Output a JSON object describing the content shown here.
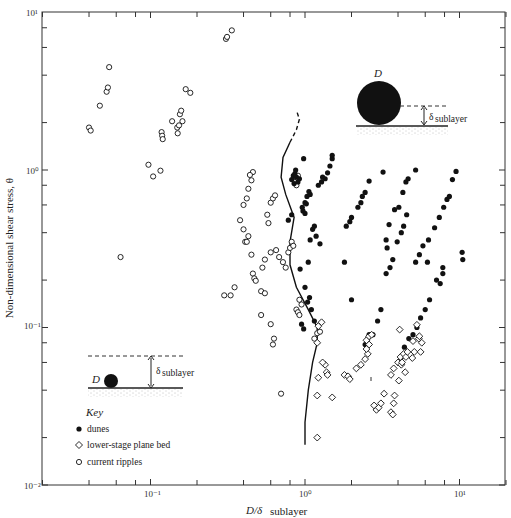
{
  "chart_data": {
    "type": "scatter",
    "title": "",
    "xlabel": "D/δ sublayer",
    "xlabel_main": "D/δ",
    "xlabel_sub": "sublayer",
    "ylabel": "Non-dimensional shear stress, θ",
    "xscale": "log",
    "yscale": "log",
    "xlim": [
      0.02,
      20
    ],
    "ylim": [
      0.01,
      10
    ],
    "grid": false,
    "x_tick_labels": [
      "10⁻¹",
      "10⁰",
      "10¹"
    ],
    "x_ticks": [
      0.1,
      1,
      10
    ],
    "y_tick_labels": [
      "10⁻²",
      "10⁻¹",
      "10⁰",
      "10¹"
    ],
    "y_ticks": [
      0.01,
      0.1,
      1,
      10
    ],
    "legend": {
      "title": "Key",
      "position": "lower-left",
      "entries": [
        {
          "marker": "filled-circle",
          "label": "dunes"
        },
        {
          "marker": "open-diamond",
          "label": "lower-stage plane bed"
        },
        {
          "marker": "open-circle",
          "label": "current ripples"
        }
      ]
    },
    "annotations": [
      {
        "text": "D",
        "context": "large grain protruding through viscous sublayer (upper right inset)"
      },
      {
        "text": "δ sublayer",
        "context": "sublayer thickness arrow in upper right inset"
      },
      {
        "text": "D",
        "context": "small grain submerged in viscous sublayer (lower left inset)"
      },
      {
        "text": "δ sublayer",
        "context": "sublayer thickness arrow in lower left inset"
      }
    ],
    "boundary_curve": {
      "description": "solid curve (dashed at top) separating ripples from dunes/plane bed",
      "points": [
        [
          1.0,
          0.018
        ],
        [
          1.0,
          0.025
        ],
        [
          1.05,
          0.04
        ],
        [
          1.12,
          0.06
        ],
        [
          1.2,
          0.08
        ],
        [
          1.2,
          0.1
        ],
        [
          1.05,
          0.13
        ],
        [
          0.88,
          0.18
        ],
        [
          0.8,
          0.25
        ],
        [
          0.8,
          0.35
        ],
        [
          0.85,
          0.5
        ],
        [
          0.75,
          0.7
        ],
        [
          0.7,
          0.9
        ],
        [
          0.72,
          1.2
        ],
        [
          0.8,
          1.5
        ]
      ],
      "dashed_points": [
        [
          0.8,
          1.5
        ],
        [
          0.88,
          1.8
        ],
        [
          0.92,
          2.1
        ],
        [
          0.88,
          2.4
        ]
      ]
    },
    "series": [
      {
        "name": "current ripples",
        "marker": "open-circle",
        "points": [
          [
            0.04,
            1.86
          ],
          [
            0.041,
            1.78
          ],
          [
            0.047,
            2.56
          ],
          [
            0.052,
            3.14
          ],
          [
            0.053,
            3.34
          ],
          [
            0.054,
            4.5
          ],
          [
            0.064,
            0.28
          ],
          [
            0.097,
            1.08
          ],
          [
            0.104,
            0.91
          ],
          [
            0.116,
            0.99
          ],
          [
            0.118,
            1.74
          ],
          [
            0.119,
            1.65
          ],
          [
            0.12,
            1.57
          ],
          [
            0.138,
            2.04
          ],
          [
            0.149,
            1.86
          ],
          [
            0.15,
            1.71
          ],
          [
            0.153,
            1.92
          ],
          [
            0.155,
            2.26
          ],
          [
            0.158,
            2.38
          ],
          [
            0.161,
            2.04
          ],
          [
            0.169,
            3.26
          ],
          [
            0.181,
            3.09
          ],
          [
            0.308,
            6.8
          ],
          [
            0.313,
            7.0
          ],
          [
            0.336,
            7.7
          ],
          [
            0.3,
            0.16
          ],
          [
            0.33,
            0.16
          ],
          [
            0.35,
            0.18
          ],
          [
            0.4,
            0.6
          ],
          [
            0.42,
            0.66
          ],
          [
            0.43,
            0.76
          ],
          [
            0.45,
            0.86
          ],
          [
            0.46,
            0.97
          ],
          [
            0.44,
            0.93
          ],
          [
            0.41,
            0.35
          ],
          [
            0.42,
            0.35
          ],
          [
            0.43,
            0.38
          ],
          [
            0.38,
            0.48
          ],
          [
            0.4,
            0.42
          ],
          [
            0.46,
            0.22
          ],
          [
            0.47,
            0.205
          ],
          [
            0.48,
            0.198
          ],
          [
            0.45,
            0.29
          ],
          [
            0.52,
            0.17
          ],
          [
            0.55,
            0.165
          ],
          [
            0.52,
            0.12
          ],
          [
            0.62,
            0.078
          ],
          [
            0.63,
            0.085
          ],
          [
            0.6,
            0.105
          ],
          [
            0.7,
            0.038
          ],
          [
            0.6,
            0.3
          ],
          [
            0.65,
            0.31
          ],
          [
            0.68,
            0.28
          ],
          [
            0.72,
            0.26
          ],
          [
            0.75,
            0.24
          ],
          [
            0.53,
            0.24
          ],
          [
            0.55,
            0.27
          ],
          [
            0.58,
            0.46
          ],
          [
            0.57,
            0.52
          ],
          [
            0.78,
            0.3
          ],
          [
            0.8,
            0.32
          ],
          [
            0.82,
            0.35
          ],
          [
            0.84,
            0.33
          ],
          [
            0.6,
            0.62
          ],
          [
            0.62,
            0.66
          ],
          [
            0.64,
            0.69
          ],
          [
            0.88,
            0.13
          ],
          [
            0.9,
            0.125
          ],
          [
            0.92,
            0.15
          ],
          [
            0.95,
            0.14
          ],
          [
            0.92,
            0.12
          ],
          [
            0.85,
            0.9
          ],
          [
            0.9,
            0.92
          ],
          [
            0.88,
            0.8
          ],
          [
            1.15,
            0.085
          ],
          [
            1.2,
            0.092
          ],
          [
            1.25,
            0.094
          ]
        ]
      },
      {
        "name": "dunes",
        "marker": "filled-circle",
        "points": [
          [
            0.82,
            0.87
          ],
          [
            0.84,
            0.92
          ],
          [
            0.86,
            0.95
          ],
          [
            0.88,
            0.9
          ],
          [
            0.85,
            0.82
          ],
          [
            0.9,
            0.84
          ],
          [
            0.92,
            0.88
          ],
          [
            0.87,
            1.0
          ],
          [
            0.98,
            1.18
          ],
          [
            0.96,
            0.58
          ],
          [
            1.0,
            0.62
          ],
          [
            0.97,
            0.55
          ],
          [
            1.03,
            0.68
          ],
          [
            1.0,
            0.53
          ],
          [
            1.06,
            0.73
          ],
          [
            1.08,
            0.7
          ],
          [
            1.02,
            0.61
          ],
          [
            1.22,
            0.8
          ],
          [
            1.28,
            0.84
          ],
          [
            1.35,
            0.88
          ],
          [
            1.4,
            0.96
          ],
          [
            1.45,
            1.06
          ],
          [
            1.3,
            0.9
          ],
          [
            1.5,
            1.18
          ],
          [
            1.5,
            1.24
          ],
          [
            1.08,
            0.36
          ],
          [
            1.12,
            0.42
          ],
          [
            1.15,
            0.44
          ],
          [
            1.18,
            0.38
          ],
          [
            1.25,
            0.34
          ],
          [
            0.78,
            0.48
          ],
          [
            0.82,
            0.52
          ],
          [
            1.1,
            0.13
          ],
          [
            0.95,
            0.105
          ],
          [
            0.98,
            0.098
          ],
          [
            1.15,
            0.11
          ],
          [
            1.04,
            0.145
          ],
          [
            1.07,
            0.155
          ],
          [
            1.0,
            0.18
          ],
          [
            0.93,
            0.235
          ],
          [
            1.05,
            0.26
          ],
          [
            1.85,
            0.44
          ],
          [
            1.95,
            0.47
          ],
          [
            2.0,
            0.5
          ],
          [
            2.2,
            0.58
          ],
          [
            2.3,
            0.62
          ],
          [
            2.45,
            0.72
          ],
          [
            2.6,
            0.85
          ],
          [
            2.35,
            0.68
          ],
          [
            1.8,
            0.26
          ],
          [
            2.0,
            0.15
          ],
          [
            2.55,
            0.085
          ],
          [
            2.6,
            0.09
          ],
          [
            2.75,
            0.09
          ],
          [
            2.45,
            0.078
          ],
          [
            3.2,
            0.97
          ],
          [
            3.5,
            0.45
          ],
          [
            3.35,
            0.36
          ],
          [
            3.4,
            0.32
          ],
          [
            3.8,
            0.56
          ],
          [
            4.05,
            0.58
          ],
          [
            4.3,
            0.72
          ],
          [
            4.5,
            0.84
          ],
          [
            4.65,
            0.88
          ],
          [
            5.2,
            1.0
          ],
          [
            2.95,
            0.11
          ],
          [
            3.1,
            0.13
          ],
          [
            3.35,
            0.22
          ],
          [
            3.55,
            0.24
          ],
          [
            3.7,
            0.27
          ],
          [
            3.95,
            0.35
          ],
          [
            4.2,
            0.4
          ],
          [
            4.35,
            0.44
          ],
          [
            4.55,
            0.52
          ],
          [
            5.2,
            0.26
          ],
          [
            5.5,
            0.29
          ],
          [
            5.8,
            0.33
          ],
          [
            6.3,
            0.36
          ],
          [
            6.9,
            0.43
          ],
          [
            7.4,
            0.5
          ],
          [
            7.9,
            0.58
          ],
          [
            8.3,
            0.65
          ],
          [
            8.6,
            0.68
          ],
          [
            9.0,
            0.87
          ],
          [
            9.5,
            0.98
          ],
          [
            4.2,
            0.065
          ],
          [
            4.4,
            0.075
          ],
          [
            4.7,
            0.085
          ],
          [
            5.0,
            0.09
          ],
          [
            5.3,
            0.1
          ],
          [
            5.6,
            0.115
          ],
          [
            6.0,
            0.13
          ],
          [
            6.4,
            0.15
          ],
          [
            6.2,
            0.26
          ],
          [
            7.1,
            0.2
          ],
          [
            7.5,
            0.19
          ],
          [
            7.8,
            0.22
          ],
          [
            7.8,
            0.24
          ],
          [
            10.4,
            0.3
          ],
          [
            10.5,
            0.27
          ]
        ]
      },
      {
        "name": "lower-stage plane bed",
        "marker": "open-diamond",
        "points": [
          [
            1.22,
            0.102
          ],
          [
            1.28,
            0.108
          ],
          [
            1.2,
            0.08
          ],
          [
            1.35,
            0.058
          ],
          [
            1.38,
            0.052
          ],
          [
            1.3,
            0.06
          ],
          [
            1.4,
            0.05
          ],
          [
            1.22,
            0.048
          ],
          [
            1.2,
            0.037
          ],
          [
            1.5,
            0.036
          ],
          [
            1.2,
            0.02
          ],
          [
            1.8,
            0.05
          ],
          [
            1.9,
            0.049
          ],
          [
            1.95,
            0.047
          ],
          [
            2.15,
            0.055
          ],
          [
            2.3,
            0.058
          ],
          [
            2.45,
            0.063
          ],
          [
            2.55,
            0.068
          ],
          [
            2.5,
            0.073
          ],
          [
            2.6,
            0.078
          ],
          [
            2.5,
            0.083
          ],
          [
            2.6,
            0.088
          ],
          [
            2.7,
            0.09
          ],
          [
            2.8,
            0.032
          ],
          [
            2.9,
            0.03
          ],
          [
            3.0,
            0.031
          ],
          [
            3.1,
            0.033
          ],
          [
            3.25,
            0.038
          ],
          [
            3.6,
            0.05
          ],
          [
            3.75,
            0.055
          ],
          [
            4.0,
            0.06
          ],
          [
            4.15,
            0.065
          ],
          [
            4.35,
            0.068
          ],
          [
            4.5,
            0.065
          ],
          [
            4.2,
            0.058
          ],
          [
            4.6,
            0.07
          ],
          [
            4.05,
            0.046
          ],
          [
            4.25,
            0.06
          ],
          [
            4.1,
            0.097
          ],
          [
            5.1,
            0.07
          ],
          [
            5.0,
            0.082
          ],
          [
            5.45,
            0.085
          ],
          [
            5.5,
            0.088
          ],
          [
            5.7,
            0.08
          ],
          [
            5.3,
            0.104
          ],
          [
            5.6,
            0.07
          ],
          [
            4.95,
            0.064
          ],
          [
            4.45,
            0.052
          ],
          [
            3.6,
            0.029
          ],
          [
            3.7,
            0.028
          ],
          [
            3.75,
            0.033
          ],
          [
            3.8,
            0.037
          ]
        ]
      }
    ]
  },
  "insets": {
    "upper": {
      "grain_label": "D",
      "delta_symbol": "δ",
      "delta_sub": "sublayer"
    },
    "lower": {
      "grain_label": "D",
      "delta_symbol": "δ",
      "delta_sub": "sublayer"
    }
  }
}
